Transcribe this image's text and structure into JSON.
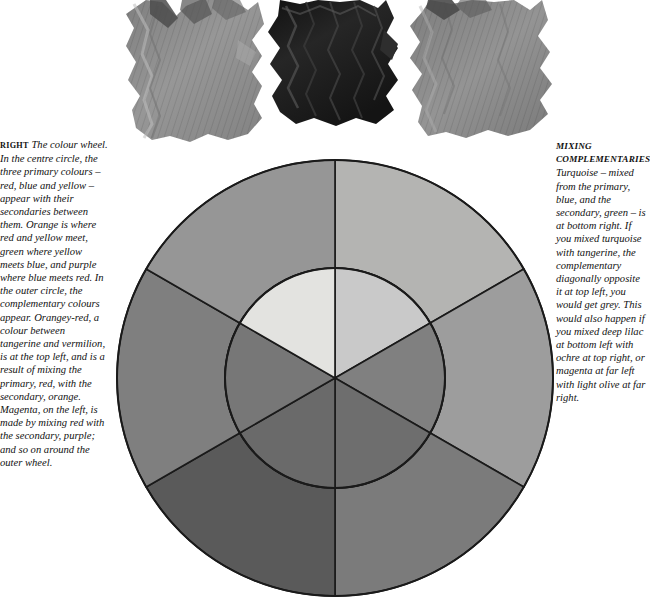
{
  "page": {
    "title": "The colour wheel",
    "background": "#ffffff"
  },
  "swatches": {
    "label": "oil paint swatches",
    "items": [
      {
        "name": "swatch-left",
        "description": "thick mid-grey paint smear",
        "color": "#8e8e8e",
        "x": 118,
        "y": 0,
        "w": 150,
        "h": 148
      },
      {
        "name": "swatch-centre",
        "description": "very dark near-black paint smear",
        "color": "#232323",
        "x": 262,
        "y": 0,
        "w": 150,
        "h": 130
      },
      {
        "name": "swatch-right",
        "description": "mid-grey paint smear",
        "color": "#8a8a8a",
        "x": 412,
        "y": 0,
        "w": 150,
        "h": 146
      }
    ]
  },
  "caption_left": {
    "lead": "RIGHT",
    "body": "The colour wheel. In the centre circle, the three primary colours – red, blue and yellow – appear with their secondaries between them. Orange is where red and yellow meet, green where yellow meets blue, and purple where blue meets red. In the outer circle, the complementary colours appear. Orangey-red, a colour between tangerine and vermilion, is at the top left, and is a result of mixing the primary, red, with the secondary, orange. Magenta, on the left, is made by mixing red with the secondary, purple; and so on around the outer wheel."
  },
  "caption_right": {
    "heading_line1": "MIXING",
    "heading_line2": "COMPLEMENTARIES",
    "body": "Turquoise – mixed from the primary, blue, and the secondary, green – is at bottom right. If you mixed turquoise with tangerine, the complementary diagonally opposite it at top left, you would get grey. This would also happen if you mixed deep lilac at bottom left with ochre at top right, or magenta at far left with light olive at far right."
  },
  "wheel": {
    "name": "colour-wheel",
    "centre_x": 222,
    "centre_y": 222,
    "outer_radius": 218,
    "inner_radius": 110,
    "stroke": "#1a1a1a",
    "stroke_width": 1.6,
    "inner_segments": [
      {
        "name": "inner-orange",
        "label": "orange",
        "colour": "#c9c9c9",
        "start_deg": 0,
        "end_deg": 60
      },
      {
        "name": "inner-red",
        "label": "red",
        "colour": "#808080",
        "start_deg": 60,
        "end_deg": 120
      },
      {
        "name": "inner-purple",
        "label": "purple",
        "colour": "#6e6e6e",
        "start_deg": 120,
        "end_deg": 180
      },
      {
        "name": "inner-blue",
        "label": "blue",
        "colour": "#6a6a6a",
        "start_deg": 180,
        "end_deg": 240
      },
      {
        "name": "inner-green",
        "label": "green",
        "colour": "#777777",
        "start_deg": 240,
        "end_deg": 300
      },
      {
        "name": "inner-yellow",
        "label": "yellow",
        "colour": "#e3e3e0",
        "start_deg": 300,
        "end_deg": 360
      }
    ],
    "outer_segments": [
      {
        "name": "outer-ochre",
        "label": "ochre",
        "colour": "#b4b4b2",
        "start_deg": 0,
        "end_deg": 60
      },
      {
        "name": "outer-tangerine",
        "label": "tangerine",
        "colour": "#9d9d9d",
        "start_deg": 60,
        "end_deg": 120
      },
      {
        "name": "outer-magenta",
        "label": "magenta",
        "colour": "#7b7b7b",
        "start_deg": 120,
        "end_deg": 180
      },
      {
        "name": "outer-deep-lilac",
        "label": "deep lilac",
        "colour": "#5a5a5a",
        "start_deg": 180,
        "end_deg": 240
      },
      {
        "name": "outer-turquoise",
        "label": "turquoise",
        "colour": "#7f7f7f",
        "start_deg": 240,
        "end_deg": 300
      },
      {
        "name": "outer-light-olive",
        "label": "light olive",
        "colour": "#969696",
        "start_deg": 300,
        "end_deg": 360
      }
    ]
  }
}
